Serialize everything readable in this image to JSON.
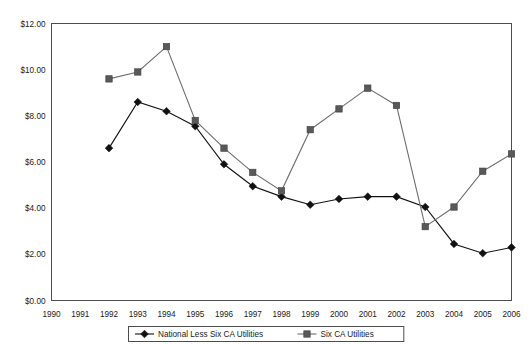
{
  "chart_data": {
    "type": "line",
    "title": "",
    "subtitle": "",
    "xlabel": "",
    "ylabel": "",
    "grid": "horizontal",
    "legend_position": "bottom-center",
    "x": [
      1990,
      1991,
      1992,
      1993,
      1994,
      1995,
      1996,
      1997,
      1998,
      1999,
      2000,
      2001,
      2002,
      2003,
      2004,
      2005,
      2006
    ],
    "categories": [
      "1990",
      "1991",
      "1992",
      "1993",
      "1994",
      "1995",
      "1996",
      "1997",
      "1998",
      "1999",
      "2000",
      "2001",
      "2002",
      "2003",
      "2004",
      "2005",
      "2006"
    ],
    "xlim": [
      1990,
      2006
    ],
    "ylim": [
      0,
      12
    ],
    "ytick_values": [
      0,
      2,
      4,
      6,
      8,
      10,
      12
    ],
    "ytick_labels": [
      "$0.00",
      "$2.00",
      "$4.00",
      "$6.00",
      "$8.00",
      "$10.00",
      "$12.00"
    ],
    "series": [
      {
        "name": "National Less Six CA Utilities",
        "marker": "diamond",
        "color": "#111111",
        "x": [
          1992,
          1993,
          1994,
          1995,
          1996,
          1997,
          1998,
          1999,
          2000,
          2001,
          2002,
          2003,
          2004,
          2005,
          2006
        ],
        "values": [
          6.6,
          8.6,
          8.2,
          7.55,
          5.9,
          4.95,
          4.5,
          4.15,
          4.4,
          4.5,
          4.5,
          4.05,
          2.45,
          2.05,
          2.3
        ]
      },
      {
        "name": "Six CA Utilities",
        "marker": "square",
        "color": "#595959",
        "x": [
          1992,
          1993,
          1994,
          1995,
          1996,
          1997,
          1998,
          1999,
          2000,
          2001,
          2002,
          2003,
          2004,
          2005,
          2006
        ],
        "values": [
          9.6,
          9.9,
          11.0,
          7.8,
          6.6,
          5.55,
          4.75,
          7.4,
          8.3,
          9.2,
          8.45,
          3.2,
          4.05,
          5.6,
          6.35
        ]
      }
    ]
  },
  "legend": {
    "items": [
      {
        "label": "National Less Six CA Utilities",
        "marker": "diamond"
      },
      {
        "label": "Six CA Utilities",
        "marker": "square"
      }
    ]
  },
  "colors": {
    "series_a": "#111111",
    "series_b": "#595959",
    "gridline": "#a6a6a6",
    "frame": "#4d4d4d",
    "background": "#ffffff",
    "text": "#1a1a1a"
  }
}
